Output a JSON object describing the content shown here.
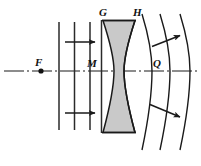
{
  "figure": {
    "background_color": "#ffffff",
    "stroke_color": "#1a1a1a",
    "lens_fill_color": "#c9c9c9",
    "width": 201,
    "height": 166
  },
  "labels": {
    "focal_point": "F",
    "incident_wavefront": "M",
    "lens_front_surface": "G",
    "lens_back_surface": "H",
    "emergent_wavefront": "Q"
  },
  "axis": {
    "name": "optical-axis",
    "style": "dash-dot",
    "y": 71,
    "x_start": 4,
    "x_end": 199
  },
  "focal_point_marker": {
    "x": 41,
    "y": 71,
    "radius": 2.6
  },
  "plane_wavefronts": {
    "count": 3,
    "orientation": "vertical",
    "x_positions": [
      59,
      74,
      90
    ],
    "y_top": 22,
    "y_bottom": 130
  },
  "spherical_wavefronts": {
    "count": 3,
    "orientation": "convex-right",
    "axis_crossings": [
      152,
      170,
      190
    ],
    "y_top": 14,
    "y_bottom": 150
  },
  "lens": {
    "type": "biconcave",
    "left_edge_x": 101,
    "right_edge_x": 137,
    "top_y": 20,
    "bottom_y": 133,
    "waist_half_width": 6
  },
  "direction_arrows": [
    {
      "name": "incident-ray-arrow-upper",
      "x1": 65,
      "y1": 42,
      "x2": 95,
      "y2": 42
    },
    {
      "name": "incident-ray-arrow-lower",
      "x1": 65,
      "y1": 113,
      "x2": 95,
      "y2": 113
    },
    {
      "name": "emergent-ray-arrow-upper",
      "x1": 152,
      "y1": 46,
      "x2": 180,
      "y2": 36
    },
    {
      "name": "emergent-ray-arrow-lower",
      "x1": 150,
      "y1": 105,
      "x2": 180,
      "y2": 117
    }
  ]
}
